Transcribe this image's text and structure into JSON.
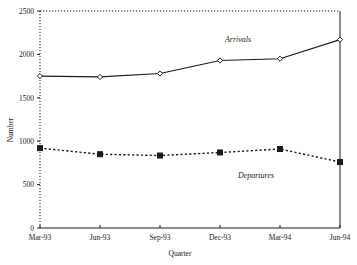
{
  "chart_data": {
    "type": "line",
    "title": "",
    "xlabel": "Quarter",
    "ylabel": "Number",
    "categories": [
      "Mar-93",
      "Jun-93",
      "Sep-93",
      "Dec-93",
      "Mar-94",
      "Jun-94"
    ],
    "ylim": [
      0,
      2500
    ],
    "yticks": [
      0,
      500,
      1000,
      1500,
      2000,
      2500
    ],
    "ytick_labels": [
      "0",
      "500",
      "1000",
      "1500",
      "2000",
      "2500"
    ],
    "grid": false,
    "legend": "inline-annotations",
    "series": [
      {
        "name": "Arrivals",
        "values": [
          1750,
          1740,
          1780,
          1930,
          1950,
          2170
        ],
        "line_style": "solid",
        "marker": "diamond-open",
        "color": "#1a1a1a"
      },
      {
        "name": "Departures",
        "values": [
          920,
          850,
          835,
          870,
          910,
          760
        ],
        "line_style": "dotted",
        "marker": "square-filled",
        "color": "#1a1a1a"
      }
    ],
    "annotations": [
      {
        "text": "Arrivals",
        "x_px": 238,
        "y_px": 42
      },
      {
        "text": "Departures",
        "x_px": 256,
        "y_px": 178
      }
    ]
  },
  "axes": {
    "y_axis_style": "dotted",
    "x_axis_style": "solid",
    "top_border_style": "dotted",
    "right_border_style": "solid"
  },
  "colors": {
    "ink": "#1a1a1a",
    "background": "#ffffff",
    "arrivals": "#1a1a1a",
    "departures": "#000000"
  }
}
